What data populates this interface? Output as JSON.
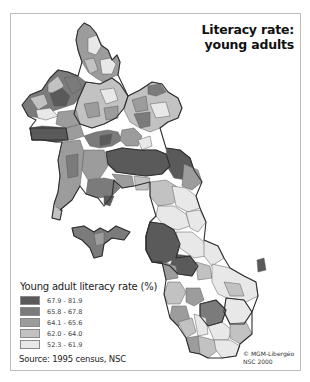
{
  "map": {
    "title_line1": "Literacy rate:",
    "title_line2": "young adults",
    "region": "Laos (provinces/districts)",
    "colors": {
      "class1": "#5a5a5a",
      "class2": "#7b7b7b",
      "class3": "#9c9c9c",
      "class4": "#c2c2c2",
      "class5": "#e8e8e8",
      "border": "#3a3a3a",
      "frame": "#bdbdbd"
    }
  },
  "legend": {
    "title": "Young adult literacy rate (%)",
    "items": [
      {
        "label": "67.9 - 81.9",
        "color": "#5a5a5a"
      },
      {
        "label": "65.8 - 67.8",
        "color": "#7b7b7b"
      },
      {
        "label": "64.1 - 65.6",
        "color": "#9c9c9c"
      },
      {
        "label": "62.0 - 64.0",
        "color": "#c2c2c2"
      },
      {
        "label": "52.3 - 61.9",
        "color": "#e8e8e8"
      }
    ]
  },
  "source": "Source: 1995 census, NSC",
  "credit": {
    "line1": "© MGM-Libergéo",
    "line2": "NSC 2000"
  }
}
